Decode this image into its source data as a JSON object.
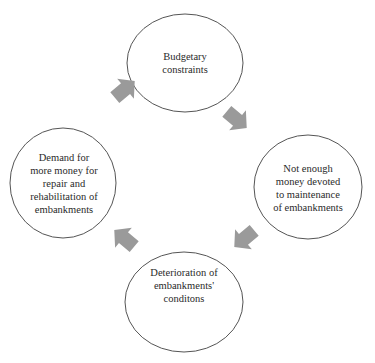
{
  "diagram": {
    "type": "cycle",
    "colors": {
      "node_stroke": "#555555",
      "arrow_fill": "#9a9a9a",
      "text": "#2a2a2a"
    },
    "nodes": [
      {
        "id": "budget",
        "label": "Budgetary\nconstraints"
      },
      {
        "id": "maintenance",
        "label": "Not enough\nmoney devoted\nto maintenance\nof embankments"
      },
      {
        "id": "deterioration",
        "label": "Deterioration of\nembankments'\nconditons"
      },
      {
        "id": "demand",
        "label": "Demand for\nmore money for\nrepair and\nrehabilitation of\nembankments"
      }
    ],
    "edges": [
      {
        "from": "budget",
        "to": "maintenance"
      },
      {
        "from": "maintenance",
        "to": "deterioration"
      },
      {
        "from": "deterioration",
        "to": "demand"
      },
      {
        "from": "demand",
        "to": "budget"
      }
    ]
  }
}
